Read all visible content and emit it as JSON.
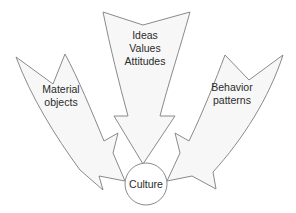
{
  "diagram": {
    "type": "convergence-arrow-diagram",
    "background_color": "#ffffff",
    "arrow_fill_color": "#f7f7f7",
    "arrow_stroke_color": "#8a8a8a",
    "text_color": "#2b2b2b",
    "hub": {
      "label": "Culture",
      "shape": "circle",
      "fill_color": "#ffffff",
      "stroke_color": "#8a8a8a"
    },
    "arrows": [
      {
        "id": "material-objects",
        "position": "left",
        "direction": "down-right",
        "lines": [
          "Material",
          "objects"
        ],
        "line1": "Material",
        "line2": "objects"
      },
      {
        "id": "ideas-values-attitudes",
        "position": "center",
        "direction": "down",
        "lines": [
          "Ideas",
          "Values",
          "Attitudes"
        ],
        "line1": "Ideas",
        "line2": "Values",
        "line3": "Attitudes"
      },
      {
        "id": "behavior-patterns",
        "position": "right",
        "direction": "down-left",
        "lines": [
          "Behavior",
          "patterns"
        ],
        "line1": "Behavior",
        "line2": "patterns"
      }
    ]
  }
}
